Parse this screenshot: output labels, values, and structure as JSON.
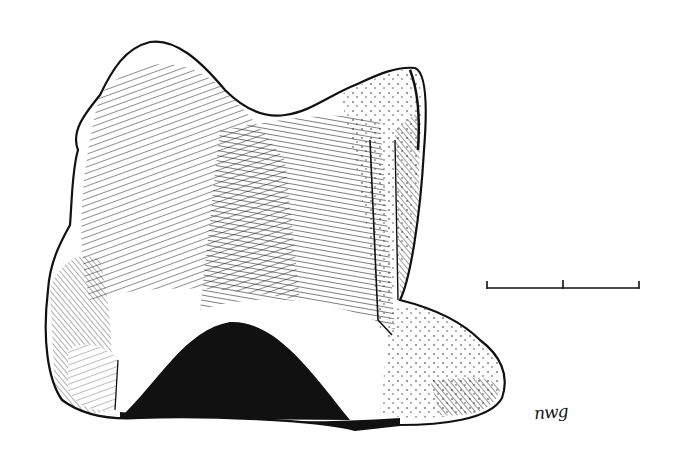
{
  "illustration": {
    "subject": "bone-specimen-drawing",
    "style": "pen-and-ink hatching",
    "ink_color": "#111111",
    "paper_color": "#ffffff"
  },
  "scale_bar": {
    "segments": 2,
    "ticks": 3
  },
  "signature": {
    "text": "nwg"
  }
}
